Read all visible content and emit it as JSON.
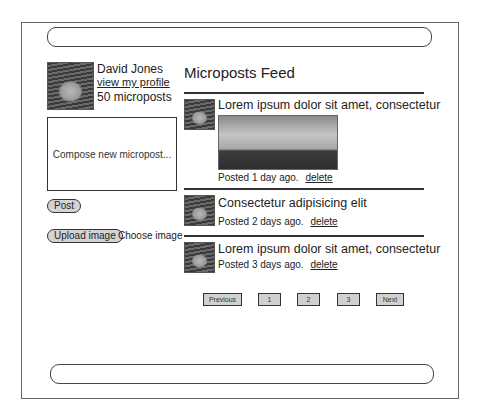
{
  "profile": {
    "name": "David Jones",
    "profile_link": "view my profile",
    "micropost_count": "50 microposts"
  },
  "compose": {
    "placeholder": "Compose new micropost...",
    "post_label": "Post",
    "upload_label": "Upload image",
    "choose_label": "Choose image"
  },
  "feed": {
    "title": "Microposts Feed",
    "delete_label": "delete",
    "posts": [
      {
        "content": "Lorem ipsum dolor sit amet, consectetur",
        "meta": "Posted 1 day ago.",
        "has_image": true
      },
      {
        "content": "Consectetur adipisicing elit",
        "meta": "Posted 2 days ago.",
        "has_image": false
      },
      {
        "content": "Lorem ipsum dolor sit amet, consectetur",
        "meta": "Posted 3 days ago.",
        "has_image": false
      }
    ]
  },
  "pagination": {
    "previous": "Previous",
    "pages": [
      "1",
      "2",
      "3"
    ],
    "next": "Next"
  }
}
